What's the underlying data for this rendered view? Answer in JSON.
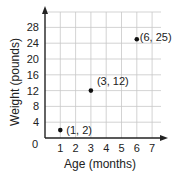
{
  "chart_data": {
    "type": "scatter",
    "title": "",
    "xlabel": "Age (months)",
    "ylabel": "Weight (pounds)",
    "xlim": [
      0,
      7
    ],
    "ylim": [
      0,
      28
    ],
    "x_ticks": [
      1,
      2,
      3,
      4,
      5,
      6,
      7
    ],
    "y_ticks": [
      4,
      8,
      12,
      16,
      20,
      24,
      28
    ],
    "origin_label": "0",
    "grid": true,
    "legend": null,
    "points": [
      {
        "x": 1,
        "y": 2,
        "label": "(1, 2)"
      },
      {
        "x": 3,
        "y": 12,
        "label": "(3, 12)"
      },
      {
        "x": 6,
        "y": 25,
        "label": "(6, 25)"
      }
    ]
  },
  "colors": {
    "axis": "#222222",
    "grid": "#c8c8c8",
    "point": "#111111"
  }
}
